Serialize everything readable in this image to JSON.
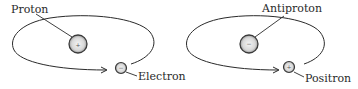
{
  "diagram": {
    "type": "atom-comparison",
    "panels": [
      {
        "name": "hydrogen",
        "nucleus": {
          "label": "Proton",
          "charge_sign": "+"
        },
        "orbiter": {
          "label": "Electron",
          "charge_sign": "−"
        }
      },
      {
        "name": "antihydrogen",
        "nucleus": {
          "label": "Antiproton",
          "charge_sign": "−"
        },
        "orbiter": {
          "label": "Positron",
          "charge_sign": "+"
        }
      }
    ],
    "colors": {
      "line": "#2a2a2a",
      "background": "#ffffff",
      "particle_fill": "#e8e8e8"
    }
  }
}
